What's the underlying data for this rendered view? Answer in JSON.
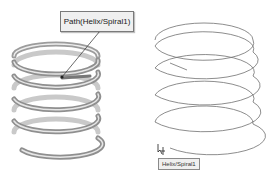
{
  "graphics_area": {
    "left_view": {
      "callout_label": "Path(Helix/Spiral1)",
      "object": "swept-spring-solid"
    },
    "right_view": {
      "tooltip_label": "Helix/Spiral1",
      "object": "helix-curve",
      "cursor": "select-curve-cursor"
    }
  },
  "colors": {
    "background": "#ffffff",
    "spring_shade": "#8a8a8a",
    "helix_line": "#6e6e6e",
    "callout_bg": "#f0f0f0"
  }
}
